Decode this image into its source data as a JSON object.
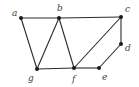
{
  "graph": {
    "nodes": [
      {
        "id": "a",
        "label": "a",
        "x": 21,
        "y": 18,
        "lx": 12,
        "ly": 16
      },
      {
        "id": "b",
        "label": "b",
        "x": 59,
        "y": 18,
        "lx": 57,
        "ly": 11
      },
      {
        "id": "c",
        "label": "c",
        "x": 121,
        "y": 17,
        "lx": 125,
        "ly": 12
      },
      {
        "id": "d",
        "label": "d",
        "x": 121,
        "y": 44,
        "lx": 125,
        "ly": 51
      },
      {
        "id": "e",
        "label": "e",
        "x": 99,
        "y": 68,
        "lx": 102,
        "ly": 80
      },
      {
        "id": "f",
        "label": "f",
        "x": 74,
        "y": 68,
        "lx": 72,
        "ly": 82
      },
      {
        "id": "g",
        "label": "g",
        "x": 37,
        "y": 69,
        "lx": 28,
        "ly": 81
      }
    ],
    "edges": [
      [
        "a",
        "b"
      ],
      [
        "b",
        "c"
      ],
      [
        "a",
        "g"
      ],
      [
        "g",
        "b"
      ],
      [
        "b",
        "f"
      ],
      [
        "g",
        "f"
      ],
      [
        "f",
        "e"
      ],
      [
        "f",
        "c"
      ],
      [
        "c",
        "d"
      ],
      [
        "d",
        "e"
      ]
    ]
  }
}
